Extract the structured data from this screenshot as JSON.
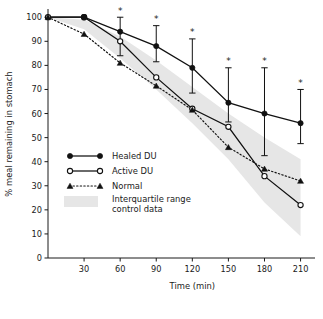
{
  "chart_data": {
    "type": "line",
    "title": "",
    "xlabel": "Time  (min)",
    "ylabel": "% meal remaining in stomach",
    "xlim": [
      0,
      222
    ],
    "ylim": [
      0,
      103
    ],
    "xticks": [
      30,
      60,
      90,
      120,
      150,
      180,
      210
    ],
    "yticks": [
      0,
      10,
      20,
      30,
      40,
      50,
      60,
      70,
      80,
      90,
      100
    ],
    "grid": false,
    "legend_position": "inside-left",
    "x": [
      0,
      30,
      60,
      90,
      120,
      150,
      180,
      210
    ],
    "series": [
      {
        "name": "Healed DU",
        "marker": "filled-circle",
        "linestyle": "solid",
        "values": [
          100,
          100,
          94,
          88,
          79,
          64.5,
          60,
          56
        ],
        "err_low": [
          null,
          null,
          84,
          81.5,
          68.5,
          56.5,
          42.5,
          47.5
        ],
        "err_high": [
          null,
          null,
          100,
          96.5,
          91,
          79,
          79,
          70
        ],
        "significance": [
          null,
          null,
          "*",
          "*",
          "*",
          "*",
          "*",
          "*"
        ]
      },
      {
        "name": "Active DU",
        "marker": "open-circle",
        "linestyle": "solid",
        "values": [
          100,
          100,
          90,
          75,
          62,
          54.5,
          34,
          22
        ]
      },
      {
        "name": "Normal",
        "marker": "filled-triangle",
        "linestyle": "dotted",
        "values": [
          100,
          93,
          81,
          71.5,
          61.5,
          46,
          37,
          32
        ]
      }
    ],
    "band": {
      "name": "Interquartile range control data",
      "legend_lines": [
        "Interquartile range",
        "control data"
      ],
      "color": "#e6e6e6",
      "x": [
        0,
        30,
        60,
        90,
        120,
        150,
        180,
        210
      ],
      "upper": [
        100,
        99,
        92,
        82,
        71,
        60,
        50,
        41
      ],
      "lower": [
        100,
        95,
        83,
        70,
        56,
        41,
        23,
        9
      ]
    },
    "annotations": {
      "significance_symbol": "*",
      "significance_times": [
        60,
        90,
        120,
        150,
        180,
        210
      ]
    }
  },
  "legend": {
    "items": [
      {
        "label": "Healed DU"
      },
      {
        "label": "Active DU"
      },
      {
        "label": "Normal"
      },
      {
        "label": "Interquartile range"
      },
      {
        "label": "control data"
      }
    ]
  }
}
